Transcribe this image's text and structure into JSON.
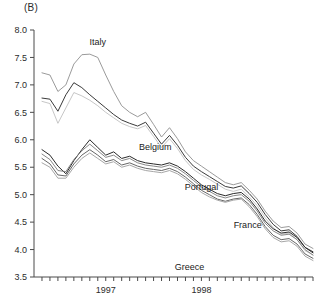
{
  "panel": {
    "label": "(B)"
  },
  "chart_data": {
    "type": "line",
    "title": "",
    "subtitle": "",
    "xlabel": "",
    "ylabel": "",
    "ylim": [
      3.5,
      8.0
    ],
    "ytick_values": [
      3.5,
      4.0,
      4.5,
      5.0,
      5.5,
      6.0,
      6.5,
      7.0,
      7.5,
      8.0
    ],
    "ytick_labels": [
      "3.5",
      "4.0",
      "4.5",
      "5.0",
      "5.5",
      "6.0",
      "6.5",
      "7.0",
      "7.5",
      "8.0"
    ],
    "xlim": [
      0,
      35
    ],
    "xtick_count": 36,
    "xtick_labels": [
      "1997",
      "1998"
    ],
    "xtick_label_positions": [
      9,
      21
    ],
    "grid": false,
    "legend_position": "inline-annotations",
    "annotations": [
      {
        "text": "Italy",
        "x": 8,
        "y": 7.72
      },
      {
        "text": "Belgium",
        "x": 15.2,
        "y": 5.82
      },
      {
        "text": "Portugal",
        "x": 21.0,
        "y": 5.08
      },
      {
        "text": "France",
        "x": 26.8,
        "y": 4.4
      },
      {
        "text": "Greece",
        "x": 19.5,
        "y": 3.62
      }
    ],
    "series": [
      {
        "name": "Italy",
        "color": "#8f8f8f",
        "width": 0.9,
        "x": [
          1,
          2,
          3,
          4,
          5,
          6,
          7,
          8,
          9,
          10,
          11,
          12,
          13,
          14,
          15,
          16,
          17,
          18,
          19,
          20,
          21,
          22,
          23,
          24,
          25,
          26,
          27,
          28,
          29,
          30,
          31,
          32,
          33,
          34,
          35
        ],
        "values": [
          7.22,
          7.18,
          6.88,
          7.0,
          7.38,
          7.55,
          7.56,
          7.5,
          7.18,
          6.88,
          6.62,
          6.5,
          6.42,
          6.5,
          6.28,
          6.05,
          6.22,
          6.02,
          5.78,
          5.62,
          5.52,
          5.42,
          5.32,
          5.22,
          5.18,
          5.22,
          5.08,
          4.92,
          4.7,
          4.52,
          4.4,
          4.42,
          4.3,
          4.1,
          4.02
        ]
      },
      {
        "name": "Italy-band-2",
        "color": "#3a3a3a",
        "width": 1.0,
        "x": [
          1,
          2,
          3,
          4,
          5,
          6,
          7,
          8,
          9,
          10,
          11,
          12,
          13,
          14,
          15,
          16,
          17,
          18,
          19,
          20,
          21,
          22,
          23,
          24,
          25,
          26,
          27,
          28,
          29,
          30,
          31,
          32,
          33,
          34,
          35
        ],
        "values": [
          6.76,
          6.74,
          6.52,
          6.82,
          7.04,
          6.95,
          6.82,
          6.7,
          6.58,
          6.46,
          6.36,
          6.3,
          6.25,
          6.32,
          6.12,
          5.92,
          6.08,
          5.9,
          5.68,
          5.52,
          5.42,
          5.33,
          5.24,
          5.15,
          5.12,
          5.16,
          5.02,
          4.86,
          4.64,
          4.46,
          4.34,
          4.36,
          4.24,
          4.04,
          3.96
        ]
      },
      {
        "name": "Italy-band-3",
        "color": "#c0c0c0",
        "width": 0.9,
        "x": [
          1,
          2,
          3,
          4,
          5,
          6,
          7,
          8,
          9,
          10,
          11,
          12,
          13,
          14,
          15,
          16,
          17,
          18,
          19,
          20,
          21,
          22,
          23,
          24,
          25,
          26,
          27,
          28,
          29,
          30,
          31,
          32,
          33,
          34,
          35
        ],
        "values": [
          6.7,
          6.66,
          6.3,
          6.58,
          6.86,
          6.8,
          6.72,
          6.62,
          6.5,
          6.4,
          6.3,
          6.24,
          6.2,
          6.26,
          6.06,
          5.86,
          6.02,
          5.84,
          5.62,
          5.46,
          5.36,
          5.28,
          5.19,
          5.1,
          5.06,
          5.1,
          4.96,
          4.8,
          4.58,
          4.4,
          4.28,
          4.3,
          4.18,
          3.98,
          3.9
        ]
      },
      {
        "name": "Belgium",
        "color": "#2a2a2a",
        "width": 1.0,
        "x": [
          1,
          2,
          3,
          4,
          5,
          6,
          7,
          8,
          9,
          10,
          11,
          12,
          13,
          14,
          15,
          16,
          17,
          18,
          19,
          20,
          21,
          22,
          23,
          24,
          25,
          26,
          27,
          28,
          29,
          30,
          31,
          32,
          33,
          34,
          35
        ],
        "values": [
          5.82,
          5.72,
          5.52,
          5.38,
          5.62,
          5.82,
          6.0,
          5.86,
          5.72,
          5.78,
          5.66,
          5.7,
          5.62,
          5.58,
          5.56,
          5.54,
          5.58,
          5.52,
          5.42,
          5.3,
          5.18,
          5.1,
          5.02,
          4.98,
          5.02,
          5.04,
          4.92,
          4.74,
          4.52,
          4.38,
          4.3,
          4.32,
          4.22,
          4.04,
          3.94
        ]
      },
      {
        "name": "Portugal",
        "color": "#7a7a7a",
        "width": 0.9,
        "x": [
          1,
          2,
          3,
          4,
          5,
          6,
          7,
          8,
          9,
          10,
          11,
          12,
          13,
          14,
          15,
          16,
          17,
          18,
          19,
          20,
          21,
          22,
          23,
          24,
          25,
          26,
          27,
          28,
          29,
          30,
          31,
          32,
          33,
          34,
          35
        ],
        "values": [
          5.74,
          5.64,
          5.44,
          5.42,
          5.64,
          5.8,
          5.92,
          5.8,
          5.68,
          5.72,
          5.62,
          5.66,
          5.58,
          5.54,
          5.52,
          5.5,
          5.54,
          5.48,
          5.38,
          5.26,
          5.14,
          5.06,
          4.98,
          4.94,
          4.98,
          5.0,
          4.88,
          4.7,
          4.48,
          4.34,
          4.26,
          4.28,
          4.18,
          4.0,
          3.9
        ]
      },
      {
        "name": "France",
        "color": "#555555",
        "width": 0.9,
        "x": [
          1,
          2,
          3,
          4,
          5,
          6,
          7,
          8,
          9,
          10,
          11,
          12,
          13,
          14,
          15,
          16,
          17,
          18,
          19,
          20,
          21,
          22,
          23,
          24,
          25,
          26,
          27,
          28,
          29,
          30,
          31,
          32,
          33,
          34,
          35
        ],
        "values": [
          5.66,
          5.56,
          5.36,
          5.34,
          5.56,
          5.72,
          5.82,
          5.72,
          5.6,
          5.64,
          5.54,
          5.58,
          5.52,
          5.48,
          5.46,
          5.44,
          5.48,
          5.42,
          5.32,
          5.2,
          5.08,
          5.0,
          4.92,
          4.88,
          4.92,
          4.94,
          4.82,
          4.64,
          4.42,
          4.26,
          4.18,
          4.2,
          4.1,
          3.92,
          3.84
        ]
      },
      {
        "name": "Greece",
        "color": "#9c9c9c",
        "width": 0.9,
        "x": [
          1,
          2,
          3,
          4,
          5,
          6,
          7,
          8,
          9,
          10,
          11,
          12,
          13,
          14,
          15,
          16,
          17,
          18,
          19,
          20,
          21,
          22,
          23,
          24,
          25,
          26,
          27,
          28,
          29,
          30,
          31,
          32,
          33,
          34,
          35
        ],
        "values": [
          5.58,
          5.5,
          5.3,
          5.3,
          5.5,
          5.66,
          5.76,
          5.66,
          5.56,
          5.6,
          5.5,
          5.54,
          5.48,
          5.44,
          5.42,
          5.4,
          5.44,
          5.38,
          5.28,
          5.16,
          5.04,
          4.96,
          4.9,
          4.86,
          4.9,
          4.92,
          4.78,
          4.6,
          4.38,
          4.22,
          4.14,
          4.16,
          4.06,
          3.88,
          3.8
        ]
      }
    ]
  }
}
